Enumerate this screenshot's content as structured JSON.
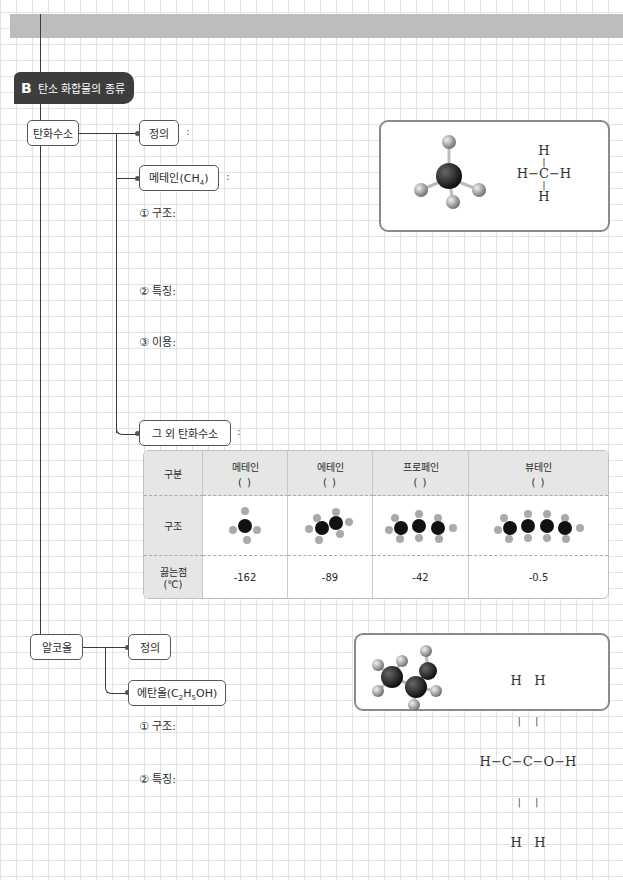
{
  "section": {
    "letter": "B",
    "title": "탄소 화합물의 종류"
  },
  "hydrocarbon": {
    "node_label": "탄화수소",
    "definition_label": "정의",
    "methane_label": "메테인(CH",
    "methane_sub": "4",
    "methane_close": ")",
    "colon": ":",
    "items": [
      "① 구조:",
      "② 특징:",
      "③ 이용:"
    ],
    "others_label": "그 외 탄화수소",
    "methane_formula": {
      "top": "H",
      "middle": "H−C−H",
      "bottom": "H"
    }
  },
  "table": {
    "header_label": "구분",
    "structure_label": "구조",
    "bp_label_line1": "끓는점",
    "bp_label_line2": "(℃)",
    "paren_blank": "(          )",
    "columns": [
      {
        "name": "메테인",
        "bp": "-162"
      },
      {
        "name": "에테인",
        "bp": "-89"
      },
      {
        "name": "프로페인",
        "bp": "-42"
      },
      {
        "name": "뷰테인",
        "bp": "-0.5"
      }
    ]
  },
  "alcohol": {
    "node_label": "알코올",
    "definition_label": "정의",
    "ethanol_label": "에탄올(C",
    "ethanol_sub1": "2",
    "ethanol_mid": "H",
    "ethanol_sub2": "5",
    "ethanol_close": "OH)",
    "items": [
      "① 구조:",
      "② 특징:"
    ],
    "ethanol_formula": {
      "top": "H   H",
      "middle": "H−C−C−O−H",
      "bottom": "H   H"
    }
  }
}
